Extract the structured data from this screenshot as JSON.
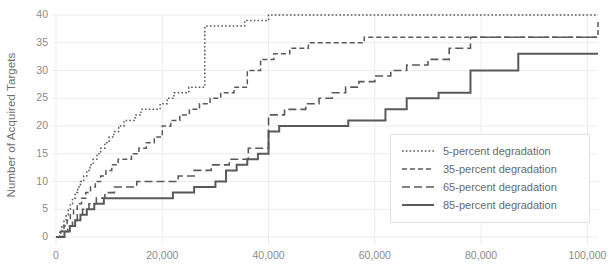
{
  "chart_data": {
    "type": "line",
    "title": "",
    "subtitle": "",
    "xlabel": "",
    "ylabel": "Number of Acquired Targets",
    "xlim": [
      0,
      102000
    ],
    "ylim": [
      0,
      40
    ],
    "grid": true,
    "legend_position": "bottom-right",
    "step_style": "post",
    "xticks": [
      0,
      20000,
      40000,
      60000,
      80000,
      100000
    ],
    "xtick_labels": [
      "0",
      "20,000",
      "40,000",
      "60,000",
      "80,000",
      "100,000"
    ],
    "yticks": [
      0,
      5,
      10,
      15,
      20,
      25,
      30,
      35,
      40
    ],
    "ytick_labels": [
      "0",
      "5",
      "10",
      "15",
      "20",
      "25",
      "30",
      "35",
      "40"
    ],
    "colors": {
      "line": "#595959",
      "grid": "#ececec",
      "axis_text": "#8a8a8a",
      "label_text": "#6e6e6e",
      "legend_border": "#e2e2e2",
      "background": "#ffffff"
    },
    "series": [
      {
        "name": "5-percent degradation",
        "label": "5-percent degradation",
        "dash": "1.6,2.2",
        "width": 1.5,
        "x": [
          0,
          700,
          1100,
          1500,
          1900,
          2300,
          2700,
          3100,
          3600,
          4100,
          4600,
          5200,
          5800,
          6400,
          7000,
          7700,
          8400,
          9200,
          10000,
          10900,
          11800,
          12800,
          13800,
          14900,
          16000,
          17200,
          18400,
          19600,
          20900,
          22200,
          23500,
          25000,
          26500,
          28000,
          31000,
          35500,
          40000,
          68000,
          102000
        ],
        "y": [
          0,
          1,
          2,
          3,
          4,
          5,
          6,
          7,
          8,
          9,
          10,
          11,
          12,
          13,
          14,
          15,
          16,
          17,
          18,
          19,
          20,
          21,
          21,
          22,
          23,
          23,
          23,
          24,
          25,
          26,
          26,
          27,
          27,
          38,
          38,
          39,
          40,
          40,
          40
        ]
      },
      {
        "name": "35-percent degradation",
        "label": "35-percent degradation",
        "dash": "5,3",
        "width": 1.5,
        "x": [
          0,
          900,
          1500,
          2100,
          2700,
          3300,
          4000,
          4800,
          5600,
          6500,
          7400,
          8400,
          9400,
          10500,
          11700,
          12900,
          14200,
          15600,
          17000,
          18500,
          20000,
          21600,
          23300,
          25100,
          27000,
          29000,
          31000,
          33500,
          36000,
          38500,
          41000,
          44000,
          47500,
          58000,
          68000,
          102000
        ],
        "y": [
          0,
          1,
          2,
          3,
          4,
          5,
          6,
          7,
          8,
          9,
          10,
          11,
          12,
          13,
          14,
          14,
          15,
          16,
          17,
          18,
          20,
          21,
          22,
          23,
          24,
          25,
          26,
          27,
          30,
          32,
          33,
          34,
          35,
          36,
          36,
          39
        ]
      },
      {
        "name": "65-percent degradation",
        "label": "65-percent degradation",
        "dash": "8,4",
        "width": 1.6,
        "x": [
          0,
          1200,
          2200,
          3100,
          4000,
          5000,
          6200,
          7600,
          9200,
          11000,
          13000,
          15200,
          17600,
          20200,
          23000,
          26000,
          29200,
          32600,
          36200,
          40000,
          41500,
          43000,
          45000,
          47000,
          49500,
          52000,
          54500,
          57000,
          60000,
          63000,
          66000,
          70000,
          74000,
          78000,
          102000
        ],
        "y": [
          0,
          1,
          2,
          3,
          4,
          5,
          6,
          7,
          8,
          9,
          9,
          10,
          10,
          10,
          11,
          12,
          13,
          14,
          16,
          22,
          22,
          23,
          23,
          24,
          25,
          26,
          27,
          28,
          29,
          30,
          31,
          32,
          34,
          36,
          36
        ]
      },
      {
        "name": "85-percent degradation",
        "label": "85-percent degradation",
        "dash": "none",
        "width": 2.0,
        "x": [
          0,
          1600,
          2600,
          3600,
          4600,
          5800,
          7200,
          9000,
          11500,
          14500,
          18000,
          22000,
          26000,
          30000,
          32000,
          34000,
          36000,
          38000,
          40000,
          42000,
          48000,
          55000,
          62000,
          66000,
          72000,
          78000,
          87000,
          102000
        ],
        "y": [
          0,
          1,
          2,
          3,
          4,
          5,
          6,
          7,
          7,
          7,
          7,
          8,
          9,
          10,
          12,
          13,
          14,
          15,
          19,
          20,
          20,
          21,
          23,
          25,
          26,
          30,
          33,
          33
        ]
      }
    ]
  }
}
